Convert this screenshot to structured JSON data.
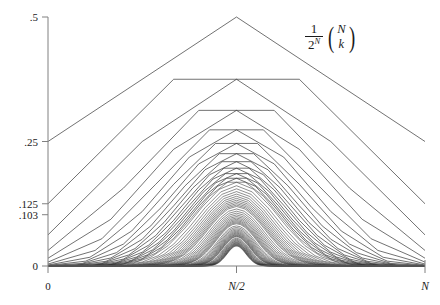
{
  "figure": {
    "title": "",
    "formula": {
      "numerator": "1",
      "denominator_base": "2",
      "denominator_exponent": "N",
      "binomial_top": "N",
      "binomial_bottom": "k",
      "left_paren": "(",
      "right_paren": ")"
    }
  },
  "axes": {
    "y_ticks": [
      {
        "label": ".5",
        "value": 0.5
      },
      {
        "label": ".25",
        "value": 0.25
      },
      {
        "label": ".125",
        "value": 0.125
      },
      {
        "label": ".103",
        "value": 0.103
      },
      {
        "label": "0",
        "value": 0
      }
    ],
    "x_ticks": [
      {
        "label": "0",
        "value": 0
      },
      {
        "label": "N/2",
        "value": 0.5
      },
      {
        "label": "N",
        "value": 1
      }
    ],
    "x_axis_title": "",
    "y_axis_title": ""
  },
  "style": {
    "background": "#ffffff",
    "axis_color": "#808080",
    "curve_color": "#2a2a2a",
    "text_color": "#1a1a1a"
  },
  "chart_data": {
    "type": "line",
    "title": "",
    "subtitle": "",
    "xlabel": "",
    "ylabel": "",
    "annotations": [
      "1/2^N (N choose k)"
    ],
    "grid": false,
    "legend": null,
    "xlim": [
      0,
      1
    ],
    "ylim": [
      0,
      0.5
    ],
    "x_tick_labels": [
      "0",
      "N/2",
      "N"
    ],
    "x_tick_values": [
      0,
      0.5,
      1
    ],
    "y_tick_labels": [
      ".5",
      ".25",
      ".125",
      ".103",
      "0"
    ],
    "y_tick_values": [
      0.5,
      0.25,
      0.125,
      0.103,
      0
    ],
    "series_N_min": 2,
    "series_N_max": 45,
    "series_peaks": [
      {
        "N": 2,
        "peak": 0.5
      },
      {
        "N": 3,
        "peak": 0.375
      },
      {
        "N": 4,
        "peak": 0.375
      },
      {
        "N": 5,
        "peak": 0.3125
      },
      {
        "N": 6,
        "peak": 0.3125
      },
      {
        "N": 7,
        "peak": 0.2734
      },
      {
        "N": 8,
        "peak": 0.2734
      },
      {
        "N": 9,
        "peak": 0.2461
      },
      {
        "N": 10,
        "peak": 0.2461
      },
      {
        "N": 12,
        "peak": 0.2256
      },
      {
        "N": 14,
        "peak": 0.2095
      },
      {
        "N": 16,
        "peak": 0.1964
      },
      {
        "N": 18,
        "peak": 0.1855
      },
      {
        "N": 20,
        "peak": 0.1762
      },
      {
        "N": 24,
        "peak": 0.1612
      },
      {
        "N": 28,
        "peak": 0.1494
      },
      {
        "N": 32,
        "peak": 0.1399
      },
      {
        "N": 36,
        "peak": 0.1321
      },
      {
        "N": 40,
        "peak": 0.1254
      },
      {
        "N": 45,
        "peak": 0.1186
      },
      {
        "N": 60,
        "peak": 0.1029
      }
    ]
  }
}
